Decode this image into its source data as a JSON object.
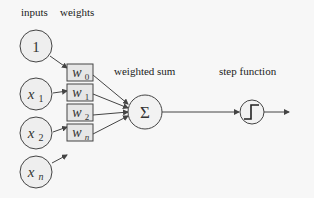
{
  "diagram": {
    "title_labels": {
      "inputs": "inputs",
      "weights": "weights",
      "weighted_sum": "weighted sum",
      "step_function": "step function"
    },
    "inputs": [
      {
        "symbol": "1",
        "sub": ""
      },
      {
        "symbol": "x",
        "sub": "1"
      },
      {
        "symbol": "x",
        "sub": "2"
      },
      {
        "symbol": "x",
        "sub": "n"
      }
    ],
    "weights": [
      {
        "symbol": "w",
        "sub": "0"
      },
      {
        "symbol": "w",
        "sub": "1"
      },
      {
        "symbol": "w",
        "sub": "2"
      },
      {
        "symbol": "w",
        "sub": "n"
      }
    ],
    "sum_symbol": "Σ",
    "colors": {
      "background": "#f7f7f7",
      "node_fill": "#eeeeee",
      "weight_fill": "#e6e6e6",
      "stroke": "#444444"
    }
  }
}
